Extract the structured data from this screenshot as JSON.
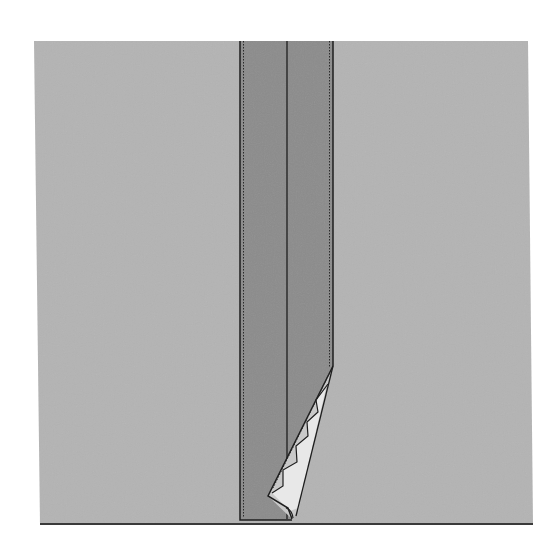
{
  "figure": {
    "type": "sewing-illustration",
    "colors": {
      "background": "#ffffff",
      "fabric_panel": "#b4b4b4",
      "strip": "#8c8c8c",
      "flap_underside": "#c9c9c9",
      "flap_inner": "#e6e6e6",
      "outline": "#1e1e1e",
      "bottom_edge": "#3a3a3a"
    },
    "parts": [
      {
        "name": "fabric-panel",
        "shape": "quadrilateral",
        "points": [
          [
            34,
            41
          ],
          [
            528,
            41
          ],
          [
            533,
            524
          ],
          [
            40,
            524
          ]
        ]
      },
      {
        "name": "center-strip",
        "x_left": 240,
        "x_right": 333,
        "center_line_x": 287,
        "top": 41,
        "bottom": 520
      },
      {
        "name": "left-stitch-line",
        "x": 243,
        "style": "dotted"
      },
      {
        "name": "right-stitch-line",
        "x": 330,
        "style": "dotted"
      },
      {
        "name": "folded-flap",
        "fold_start": [
          333,
          366
        ],
        "tip": [
          268,
          496
        ],
        "bottom": [
          292,
          519
        ]
      }
    ]
  }
}
